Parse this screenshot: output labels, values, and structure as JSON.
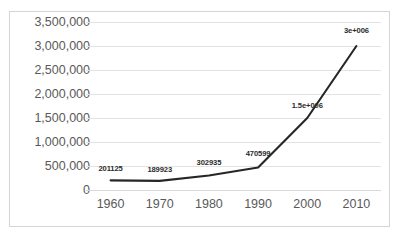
{
  "chart_data": {
    "type": "line",
    "title": "",
    "xlabel": "",
    "ylabel": "",
    "categories": [
      "1960",
      "1970",
      "1980",
      "1990",
      "2000",
      "2010"
    ],
    "values": [
      201125,
      189923,
      302935,
      470599,
      1500000,
      3000000
    ],
    "point_labels": [
      "201125",
      "189923",
      "302935",
      "470599",
      "1.5e+006",
      "3e+006"
    ],
    "series": [
      {
        "name": "",
        "values": [
          201125,
          189923,
          302935,
          470599,
          1500000,
          3000000
        ]
      }
    ],
    "ylim": [
      0,
      3500000
    ],
    "y_ticks": [
      3500000,
      3000000,
      2500000,
      2000000,
      1500000,
      1000000,
      500000,
      0
    ],
    "y_tick_labels": [
      "3,500,000",
      "3,000,000",
      "2,500,000",
      "2,000,000",
      "1,500,000",
      "1,000,000",
      "500,000",
      "0"
    ],
    "x_tick_labels": [
      "1960",
      "1970",
      "1980",
      "1990",
      "2000",
      "2010"
    ],
    "grid": "horizontal",
    "legend": "none",
    "line_color": "#262626",
    "gridline_color": "#e2e2e2",
    "tick_label_color": "#595959",
    "data_label_color": "#2b2b2b",
    "border_color": "#d4d4d4",
    "background_color": "#ffffff"
  }
}
